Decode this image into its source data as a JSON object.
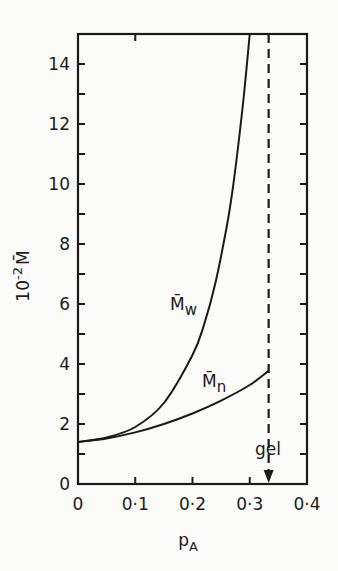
{
  "chart_data": {
    "type": "line",
    "title": "",
    "xlabel": "p_A",
    "xlabel_main": "p",
    "xlabel_sub": "A",
    "ylabel": "10^-2 M̄",
    "ylabel_prefix": "10",
    "ylabel_exp": "-2",
    "ylabel_symbol": "M̄",
    "xlim": [
      0,
      0.4
    ],
    "ylim": [
      0,
      15
    ],
    "x_ticks": [
      0,
      0.1,
      0.2,
      0.3,
      0.4
    ],
    "x_tick_labels": [
      "0",
      "0·1",
      "0·2",
      "0·3",
      "0·4"
    ],
    "x_minor_ticks": [
      0.1,
      0.2,
      0.3
    ],
    "y_ticks": [
      0,
      2,
      4,
      6,
      8,
      10,
      12,
      14
    ],
    "y_tick_labels": [
      "0",
      "2",
      "4",
      "6",
      "8",
      "10",
      "12",
      "14"
    ],
    "y_minor_ticks": [
      1,
      3,
      5,
      7,
      9,
      11,
      13
    ],
    "grid": false,
    "legend": "inline labels",
    "series": [
      {
        "name": "M̄w",
        "label_main": "M̄",
        "label_sub": "w",
        "x": [
          0,
          0.05,
          0.1,
          0.15,
          0.2,
          0.22,
          0.24,
          0.26,
          0.27,
          0.28,
          0.29,
          0.3
        ],
        "y": [
          1.4,
          1.55,
          1.9,
          2.7,
          4.3,
          5.3,
          6.7,
          8.6,
          9.8,
          11.3,
          13.0,
          15.0
        ]
      },
      {
        "name": "M̄n",
        "label_main": "M̄",
        "label_sub": "n",
        "x": [
          0,
          0.05,
          0.1,
          0.15,
          0.2,
          0.25,
          0.3,
          0.333
        ],
        "y": [
          1.4,
          1.52,
          1.72,
          2.0,
          2.35,
          2.78,
          3.3,
          3.77
        ]
      }
    ],
    "annotations": [
      {
        "type": "vertical_dashed_line",
        "x": 0.333,
        "from_y": 15,
        "to_y": 0,
        "arrow": "down"
      },
      {
        "type": "text",
        "text": "gel",
        "x": 0.333,
        "y": 1.3
      }
    ]
  }
}
